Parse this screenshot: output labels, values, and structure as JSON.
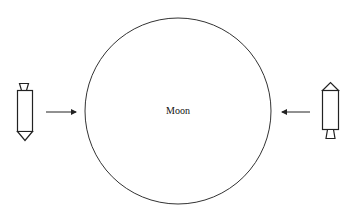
{
  "diagram": {
    "moon": {
      "label": "Moon",
      "center": [
        178,
        111
      ],
      "radius": 93
    },
    "rockets": [
      {
        "id": "left",
        "orientation": "nose-down",
        "direction": "toward-moon"
      },
      {
        "id": "right",
        "orientation": "nose-up",
        "direction": "toward-moon"
      }
    ],
    "arrows": [
      {
        "id": "left-arrow",
        "from": [
          46,
          112
        ],
        "to": [
          77,
          112
        ]
      },
      {
        "id": "right-arrow",
        "from": [
          310,
          112
        ],
        "to": [
          281,
          112
        ]
      }
    ],
    "colors": {
      "stroke": "#222222",
      "background": "#ffffff"
    }
  }
}
